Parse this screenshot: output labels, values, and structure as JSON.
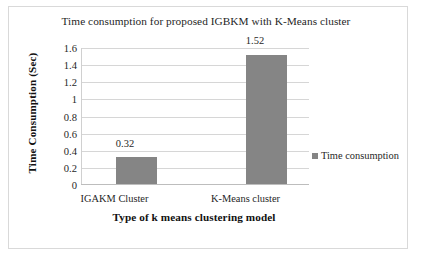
{
  "chart_data": {
    "type": "bar",
    "title": "Time consumption for proposed IGBKM with K-Means cluster",
    "categories": [
      "IGAKM Cluster",
      "K-Means cluster"
    ],
    "values": [
      0.32,
      1.52
    ],
    "data_labels": [
      "0.32",
      "1.52"
    ],
    "series": [
      {
        "name": "Time consumption",
        "values": [
          0.32,
          1.52
        ],
        "color": "#858585"
      }
    ],
    "xlabel": "Type of k means clustering model",
    "ylabel": "Time Consumption (Sec)",
    "ylim": [
      0,
      1.6
    ],
    "ytick_step": 0.2,
    "yticks": [
      1.6,
      1.4,
      1.2,
      1,
      0.8,
      0.6,
      0.4,
      0.2,
      0
    ],
    "ytick_labels": [
      "1.6",
      "1.4",
      "1.2",
      "1",
      "0.8",
      "0.6",
      "0.4",
      "0.2",
      "0"
    ],
    "grid": true,
    "grid_axis": "y",
    "legend": {
      "position": "right",
      "entries": [
        "Time consumption"
      ]
    },
    "colors": {
      "bar": "#858585",
      "gridline": "#d6d6d6",
      "border": "#d9d9d9",
      "text": "#1f1f1f"
    }
  }
}
